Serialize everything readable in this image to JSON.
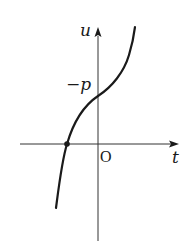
{
  "figure": {
    "type": "function-graph",
    "axes": {
      "horizontal_label": "t",
      "vertical_label": "u",
      "origin_label": "O"
    },
    "annotations": {
      "u_intercept_label": "−p"
    },
    "curve": {
      "shape": "monotonic increasing, inflection near u-intercept",
      "marked_point": "single root on negative t-axis (filled dot)"
    },
    "colors": {
      "stroke": "#1a1a1a",
      "background": "#ffffff"
    }
  }
}
